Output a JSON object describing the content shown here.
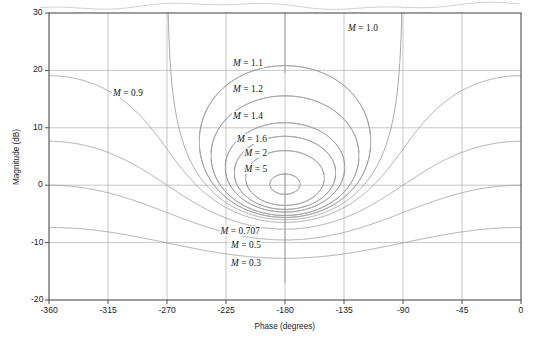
{
  "figure": {
    "type": "nichols-chart",
    "background_color": "#ffffff",
    "plot_border_color": "#4d4d4d",
    "grid_color": "#b9b9b9",
    "contour_color": "#9a9a9a"
  },
  "axes": {
    "x": {
      "label": "Phase (degrees)",
      "min": -360,
      "max": 0,
      "ticks": [
        -360,
        -315,
        -270,
        -225,
        -180,
        -135,
        -90,
        -45,
        0
      ],
      "tick_labels": [
        "-360",
        "-315",
        "-270",
        "-225",
        "-180",
        "-135",
        "-90",
        "-45",
        "0"
      ],
      "gridlines": [
        -315,
        -270,
        -225,
        -180,
        -135,
        -90,
        -45
      ]
    },
    "y": {
      "label": "Magnitude (dB)",
      "min": -20,
      "max": 30,
      "ticks": [
        30,
        20,
        10,
        0,
        -10,
        -20
      ],
      "tick_labels": [
        "30",
        "20",
        "10",
        "0",
        "-10",
        "-20"
      ],
      "gridlines": [
        20,
        10,
        0,
        -10
      ]
    }
  },
  "chart_data": {
    "type": "line",
    "title": "",
    "xlabel": "Phase (degrees)",
    "ylabel": "Magnitude (dB)",
    "xlim": [
      -360,
      0
    ],
    "ylim": [
      -20,
      30
    ],
    "grid": true,
    "legend": "none",
    "series": [
      {
        "name": "M = 0.3",
        "M": 0.3,
        "M_dB": -10.46,
        "closed": false,
        "label": "M = 0.3"
      },
      {
        "name": "M = 0.5",
        "M": 0.5,
        "M_dB": -6.02,
        "closed": false,
        "label": "M = 0.5"
      },
      {
        "name": "M = 0.707",
        "M": 0.707,
        "M_dB": -3.01,
        "closed": false,
        "label": "M = 0.707"
      },
      {
        "name": "M = 0.9",
        "M": 0.9,
        "M_dB": -0.92,
        "closed": false,
        "label": "M = 0.9"
      },
      {
        "name": "M = 1.0",
        "M": 1.0,
        "M_dB": 0.0,
        "closed": false,
        "label": "M = 1.0"
      },
      {
        "name": "M = 1.1",
        "M": 1.1,
        "M_dB": 0.83,
        "closed": true,
        "label": "M = 1.1"
      },
      {
        "name": "M = 1.2",
        "M": 1.2,
        "M_dB": 1.58,
        "closed": true,
        "label": "M = 1.2"
      },
      {
        "name": "M = 1.4",
        "M": 1.4,
        "M_dB": 2.92,
        "closed": true,
        "label": "M = 1.4"
      },
      {
        "name": "M = 1.6",
        "M": 1.6,
        "M_dB": 4.08,
        "closed": true,
        "label": "M = 1.6"
      },
      {
        "name": "M = 2",
        "M": 2.0,
        "M_dB": 6.02,
        "closed": true,
        "label": "M = 2"
      },
      {
        "name": "M = 5",
        "M": 5.0,
        "M_dB": 13.98,
        "closed": true,
        "label": "M = 5"
      }
    ],
    "contour_labels": [
      {
        "text_m": "M",
        "text_eq": "= 0.9",
        "x_px": 128,
        "y_px": 93
      },
      {
        "text_m": "M",
        "text_eq": "= 1.0",
        "x_px": 363,
        "y_px": 28
      },
      {
        "text_m": "M",
        "text_eq": "= 1.1",
        "x_px": 248,
        "y_px": 63
      },
      {
        "text_m": "M",
        "text_eq": "= 1.2",
        "x_px": 248,
        "y_px": 89
      },
      {
        "text_m": "M",
        "text_eq": "= 1.4",
        "x_px": 248,
        "y_px": 116
      },
      {
        "text_m": "M",
        "text_eq": "= 1.6",
        "x_px": 252,
        "y_px": 139
      },
      {
        "text_m": "M",
        "text_eq": "= 2",
        "x_px": 256,
        "y_px": 153
      },
      {
        "text_m": "M",
        "text_eq": "= 5",
        "x_px": 256,
        "y_px": 169
      },
      {
        "text_m": "M",
        "text_eq": "= 0.707",
        "x_px": 240,
        "y_px": 231
      },
      {
        "text_m": "M",
        "text_eq": "= 0.5",
        "x_px": 246,
        "y_px": 245
      },
      {
        "text_m": "M",
        "text_eq": "= 0.3",
        "x_px": 246,
        "y_px": 263
      }
    ]
  }
}
